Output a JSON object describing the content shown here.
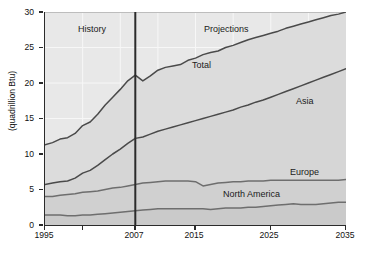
{
  "chart_data": {
    "type": "area",
    "title": "",
    "subtitle": "",
    "xlabel": "",
    "ylabel": "(quadrillion Btu)",
    "xlim": [
      1995,
      2035
    ],
    "ylim": [
      0,
      30
    ],
    "xticks": [
      1995,
      2007,
      2015,
      2025,
      2035
    ],
    "yticks": [
      0,
      5,
      10,
      15,
      20,
      25,
      30
    ],
    "grid": true,
    "legend_position": "inline-labels",
    "annotations": [
      {
        "text": "History",
        "x": 2000.0,
        "y": 27.3
      },
      {
        "text": "Projections",
        "x": 2019.0,
        "y": 27.3
      },
      {
        "text": "Total",
        "x": 2017.0,
        "y": 22.2
      },
      {
        "text": "Asia",
        "x": 2029.5,
        "y": 17.1
      },
      {
        "text": "Europe",
        "x": 2029.0,
        "y": 7.6
      },
      {
        "text": "North America",
        "x": 2025.0,
        "y": 4.8
      }
    ],
    "divider": {
      "label": "2007",
      "x": 2007
    },
    "x": [
      1995,
      1996,
      1997,
      1998,
      1999,
      2000,
      2001,
      2002,
      2003,
      2004,
      2005,
      2006,
      2007,
      2008,
      2009,
      2010,
      2011,
      2012,
      2013,
      2014,
      2015,
      2016,
      2017,
      2018,
      2019,
      2020,
      2021,
      2022,
      2023,
      2024,
      2025,
      2026,
      2027,
      2028,
      2029,
      2030,
      2031,
      2032,
      2033,
      2034,
      2035
    ],
    "series": [
      {
        "name": "Total",
        "color": "#4a4a4a",
        "values": [
          11.3,
          11.6,
          12.1,
          12.3,
          12.9,
          14.0,
          14.5,
          15.6,
          16.9,
          18.0,
          19.1,
          20.3,
          21.1,
          20.3,
          21.0,
          21.8,
          22.2,
          22.4,
          22.6,
          23.2,
          23.5,
          24.0,
          24.3,
          24.5,
          25.0,
          25.3,
          25.7,
          26.1,
          26.4,
          26.7,
          27.0,
          27.3,
          27.7,
          28.0,
          28.3,
          28.6,
          28.9,
          29.2,
          29.5,
          29.7,
          30.0
        ]
      },
      {
        "name": "Asia",
        "color": "#4a4a4a",
        "values": [
          5.7,
          5.9,
          6.1,
          6.2,
          6.6,
          7.3,
          7.7,
          8.4,
          9.2,
          10.0,
          10.7,
          11.5,
          12.2,
          12.4,
          12.8,
          13.2,
          13.5,
          13.8,
          14.1,
          14.4,
          14.7,
          15.0,
          15.3,
          15.6,
          15.9,
          16.2,
          16.6,
          16.9,
          17.3,
          17.6,
          18.0,
          18.4,
          18.8,
          19.2,
          19.6,
          20.0,
          20.4,
          20.8,
          21.2,
          21.6,
          22.0
        ]
      },
      {
        "name": "Europe",
        "color": "#6e6e6e",
        "values": [
          4.0,
          4.0,
          4.2,
          4.3,
          4.4,
          4.6,
          4.7,
          4.8,
          5.0,
          5.2,
          5.3,
          5.5,
          5.7,
          5.9,
          6.0,
          6.1,
          6.2,
          6.2,
          6.2,
          6.2,
          6.1,
          5.5,
          5.7,
          5.9,
          6.0,
          6.1,
          6.1,
          6.2,
          6.2,
          6.2,
          6.3,
          6.3,
          6.3,
          6.3,
          6.3,
          6.3,
          6.3,
          6.3,
          6.3,
          6.3,
          6.4
        ]
      },
      {
        "name": "North America",
        "color": "#6e6e6e",
        "values": [
          1.4,
          1.4,
          1.4,
          1.3,
          1.3,
          1.4,
          1.4,
          1.5,
          1.6,
          1.7,
          1.8,
          1.9,
          2.0,
          2.1,
          2.2,
          2.3,
          2.3,
          2.3,
          2.3,
          2.3,
          2.3,
          2.3,
          2.2,
          2.3,
          2.4,
          2.4,
          2.4,
          2.5,
          2.5,
          2.6,
          2.7,
          2.8,
          2.9,
          3.0,
          2.9,
          2.9,
          2.9,
          3.0,
          3.1,
          3.2,
          3.2
        ]
      }
    ]
  },
  "axis": {
    "y_label": "(quadrillion Btu)",
    "y_ticks": [
      "30",
      "25",
      "20",
      "15",
      "10",
      "5",
      "0"
    ],
    "x_ticks": [
      "1995",
      "2007",
      "2015",
      "2025",
      "2035"
    ]
  },
  "annotations": {
    "history": "History",
    "projections": "Projections",
    "total": "Total",
    "asia": "Asia",
    "europe": "Europe",
    "north_america": "North America"
  },
  "colors": {
    "plot_background": "#e8e8e8",
    "axis": "#2b2b2b",
    "grid": "#f6f6f6",
    "line_dark": "#4a4a4a",
    "line_mid": "#6e6e6e",
    "divider": "#2b2b2b"
  }
}
